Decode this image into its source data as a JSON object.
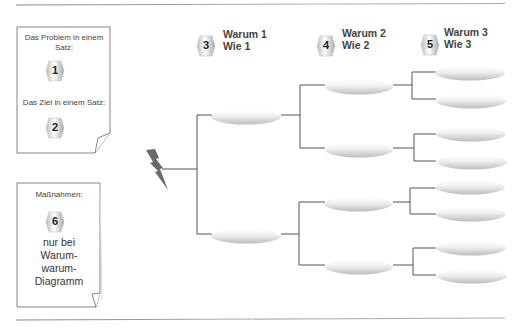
{
  "diagram": {
    "type": "why-why-tree",
    "problem_box": {
      "problem_label": "Das Problem in einem Satz:",
      "problem_badge": "1",
      "goal_label": "Das Ziel in einem Satz:",
      "goal_badge": "2"
    },
    "measures_box": {
      "title": "Maßnahmen:",
      "badge": "6",
      "note_lines": [
        "nur bei",
        "Warum-",
        "warum-",
        "Diagramm"
      ]
    },
    "column_headers": [
      {
        "badge": "3",
        "line1": "Warum 1",
        "line2": "Wie 1"
      },
      {
        "badge": "4",
        "line1": "Warum 2",
        "line2": "Wie 2"
      },
      {
        "badge": "5",
        "line1": "Warum 3",
        "line2": "Wie 3"
      }
    ],
    "root_icon": "lightning-bolt-icon",
    "levels": {
      "level1_count": 2,
      "level2_count": 4,
      "level3_count": 8
    },
    "colors": {
      "line": "#555555",
      "ellipse_light": "#ffffff",
      "ellipse_dark": "#c8c8c8",
      "bolt": "#6b6b6b",
      "rule": "#9a9a9a"
    }
  }
}
